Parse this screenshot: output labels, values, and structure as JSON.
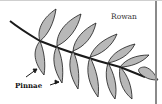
{
  "figure": {
    "title": "Rowan",
    "label": "Pinnae",
    "colors": {
      "leaflet_fill": "#b8b8b8",
      "outline": "#1a1a1a",
      "background": "#ffffff"
    }
  }
}
